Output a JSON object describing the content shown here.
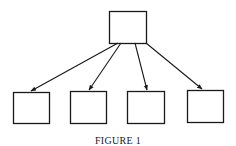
{
  "figure": {
    "caption": "FIGURE 1",
    "stroke_color": "#1a1a1a",
    "background": "#ffffff",
    "parent": {
      "x": 109,
      "y": 11,
      "w": 37,
      "h": 32
    },
    "children": [
      {
        "x": 13,
        "y": 92,
        "w": 36,
        "h": 31,
        "arrow_from": [
          118,
          43
        ],
        "arrow_to": [
          31,
          91
        ]
      },
      {
        "x": 70,
        "y": 91,
        "w": 36,
        "h": 32,
        "arrow_from": [
          121,
          43
        ],
        "arrow_to": [
          89,
          90
        ]
      },
      {
        "x": 127,
        "y": 91,
        "w": 37,
        "h": 32,
        "arrow_from": [
          135,
          43
        ],
        "arrow_to": [
          147,
          90
        ]
      },
      {
        "x": 187,
        "y": 90,
        "w": 36,
        "h": 32,
        "arrow_from": [
          146,
          43
        ],
        "arrow_to": [
          202,
          89
        ]
      }
    ]
  }
}
